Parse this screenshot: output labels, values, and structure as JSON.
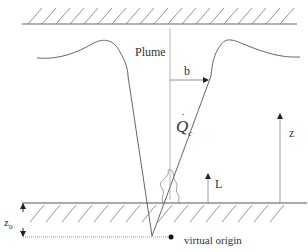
{
  "diagram": {
    "labels": {
      "plume": "Plume",
      "half_width": "b",
      "heat_release": "Q",
      "heat_release_dot": "˙",
      "heat_release_subscript": "c",
      "height": "z",
      "flame_height": "L",
      "virtual_origin_offset": "z",
      "virtual_origin_offset_subscript": "0",
      "virtual_origin": "virtual origin"
    },
    "elements": [
      "ceiling (hatched wall)",
      "plume velocity/temperature profile",
      "plume cone boundaries",
      "centerline (dotted)",
      "half-width arrow b",
      "height arrow z",
      "flame height arrow L",
      "flame",
      "floor (hatched)",
      "virtual origin point",
      "z0 offset arrows"
    ],
    "colors": {
      "line": "#555555",
      "hatch": "#777777",
      "text": "#333333"
    }
  }
}
